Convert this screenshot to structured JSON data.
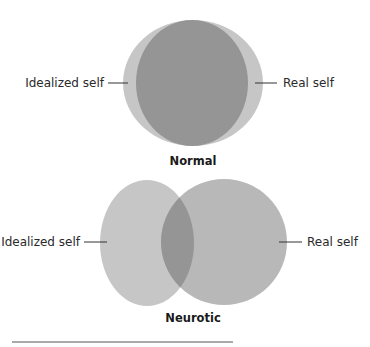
{
  "diagrams": [
    {
      "caption": "Normal",
      "left_label": "Idealized self",
      "right_label": "Real self"
    },
    {
      "caption": "Neurotic",
      "left_label": "Idealized self",
      "right_label": "Real self"
    }
  ],
  "colors": {
    "light_circle": "#c6c6c6",
    "right_circle": "#b8b8b8",
    "overlap": "#959595",
    "leader_line": "#333333",
    "rule": "#555555"
  }
}
